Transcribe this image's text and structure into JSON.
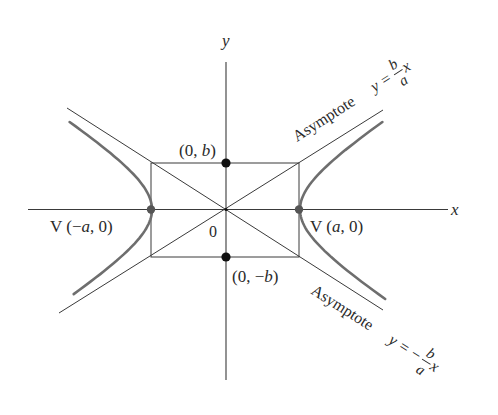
{
  "diagram": {
    "axes": {
      "x_label": "x",
      "y_label": "y",
      "origin_label": "0"
    },
    "points": {
      "co_vertex_top": "(0, b)",
      "co_vertex_bottom": "(0, −b)",
      "vertex_left": "V (−a, 0)",
      "vertex_right": "V (a, 0)"
    },
    "asymptotes": {
      "upper": {
        "prefix": "Asymptote",
        "lhs": "y =",
        "numerator": "b",
        "denominator": "a",
        "variable": "x"
      },
      "lower": {
        "prefix": "Asymptote",
        "lhs": "y = −",
        "numerator": "b",
        "denominator": "a",
        "variable": "x"
      }
    },
    "colors": {
      "line": "#3a3a3a",
      "curve": "#6e6e6e",
      "point": "#111111",
      "vertex": "#555555",
      "text": "#2a2a2a"
    },
    "geometry": {
      "center": [
        225,
        210
      ],
      "a_px": 74,
      "b_px": 47
    }
  }
}
